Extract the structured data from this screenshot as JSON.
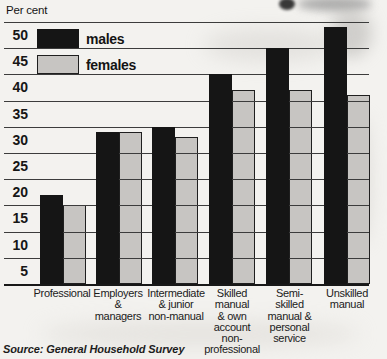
{
  "page": {
    "background_color": "#f3f2ef",
    "unit_label": "Per cent"
  },
  "legend": {
    "items": [
      {
        "label": "males",
        "color": "#151515"
      },
      {
        "label": "females",
        "color": "#c7c5c2"
      }
    ]
  },
  "chart_data": {
    "type": "bar",
    "title": "",
    "ylabel": "Per cent",
    "xlabel": "",
    "ylim": [
      0,
      52.5
    ],
    "ytick_interval": 5,
    "yticks": [
      50,
      45,
      40,
      35,
      30,
      25,
      20,
      15,
      10,
      5
    ],
    "grid": "horizontal",
    "legend_position": "top-left",
    "categories": [
      "Professional",
      "Employers & managers",
      "Intermediate & junior non-manual",
      "Skilled manual & own account non-professional",
      "Semi-skilled manual & personal service",
      "Unskilled manual"
    ],
    "category_label_lines": [
      [
        "Professional"
      ],
      [
        "Employers",
        "&",
        "managers"
      ],
      [
        "Intermediate",
        "& junior",
        "non-manual"
      ],
      [
        "Skilled",
        "manual",
        "& own",
        "account",
        "non-",
        "professional"
      ],
      [
        "Semi-",
        "skilled",
        "manual &",
        "personal",
        "service"
      ],
      [
        "Unskilled",
        "manual"
      ]
    ],
    "series": [
      {
        "name": "males",
        "color": "#151515",
        "values": [
          17,
          29,
          30,
          40,
          45,
          49
        ]
      },
      {
        "name": "females",
        "color": "#c7c5c2",
        "values": [
          15,
          29,
          28,
          37,
          37,
          36
        ]
      }
    ],
    "bar_colors": {
      "males": "#151515",
      "females": "#c7c5c2"
    },
    "gridline_color": "#3c3c3c",
    "source": "Source: General Household Survey"
  }
}
